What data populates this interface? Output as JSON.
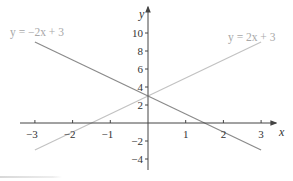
{
  "chart_data": {
    "type": "line",
    "title": "",
    "xlabel": "x",
    "ylabel": "y",
    "xlim": [
      -3.3,
      3.6
    ],
    "ylim": [
      -5,
      11.5
    ],
    "grid": false,
    "x_ticks": [
      -3,
      -2,
      -1,
      1,
      2,
      3
    ],
    "x_tick_labels": [
      "−3",
      "−2",
      "−1",
      "1",
      "2",
      "3"
    ],
    "y_ticks": [
      10,
      8,
      6,
      4,
      2,
      -2,
      -4
    ],
    "y_tick_labels": [
      "10",
      "8",
      "6",
      "4",
      "2",
      "−2",
      "−4"
    ],
    "series": [
      {
        "name": "y = −2x + 3",
        "label": "y = −2x + 3",
        "slope": -2,
        "intercept": 3,
        "x": [
          -3,
          3
        ],
        "values": [
          9,
          -3
        ],
        "color": "#888888"
      },
      {
        "name": "y = 2x + 3",
        "label": "y = 2x + 3",
        "slope": 2,
        "intercept": 3,
        "x": [
          -3,
          3
        ],
        "values": [
          -3,
          9
        ],
        "color": "#c4c4c4"
      }
    ],
    "annotations": [
      {
        "text": "y = −2x + 3",
        "position": "top-left"
      },
      {
        "text": "y = 2x + 3",
        "position": "top-right"
      }
    ],
    "intersection": [
      0,
      3
    ]
  },
  "colors": {
    "axis": "#444444",
    "line_neg": "#8a8a8a",
    "line_pos": "#c2c2c2",
    "label_text": "#a8a8a8"
  }
}
